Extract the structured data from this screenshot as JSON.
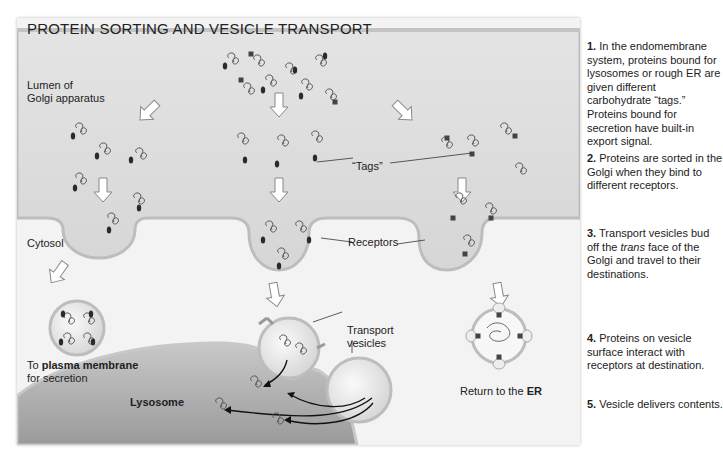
{
  "figure": {
    "title": "PROTEIN SORTING AND VESICLE TRANSPORT",
    "labels": {
      "lumen": "Lumen of Golgi apparatus",
      "lumen_line1": "Lumen of",
      "lumen_line2": "Golgi apparatus",
      "cytosol": "Cytosol",
      "tags": "“Tags”",
      "receptors": "Receptors",
      "transport_vesicles_line1": "Transport",
      "transport_vesicles_line2": "vesicles",
      "plasma_prefix": "To ",
      "plasma_bold": "plasma membrane",
      "plasma_line2": "for secretion",
      "lysosome": "Lysosome",
      "er_prefix": "Return to the ",
      "er_bold": "ER"
    },
    "colors": {
      "panel_bg": "#f3f3f3",
      "lumen_fill": "#dcdcdc",
      "membrane": "#bdbdbd",
      "lysosome_fill": "#a9a9a9",
      "tag": "#2b2b2b"
    }
  },
  "steps": [
    {
      "num": "1.",
      "text_parts": [
        "In the endomembrane system, proteins bound for lysosomes or rough ER are given different carbohydrate “tags.” Proteins bound for secretion have built-in export signal."
      ]
    },
    {
      "num": "2.",
      "text_parts": [
        "Proteins are sorted in the Golgi when they bind to different receptors."
      ]
    },
    {
      "num": "3.",
      "text_before": "Transport vesicles bud off the ",
      "text_italic": "trans",
      "text_after": " face of the Golgi and travel to their destinations."
    },
    {
      "num": "4.",
      "text_parts": [
        "Proteins on vesicle surface interact with receptors at destination."
      ]
    },
    {
      "num": "5.",
      "text_parts": [
        "Vesicle delivers contents."
      ]
    }
  ]
}
